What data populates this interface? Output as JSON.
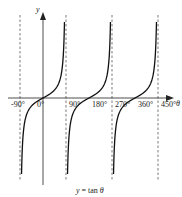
{
  "chart_data": {
    "type": "line",
    "title": "",
    "caption": "y = tan θ",
    "xlabel": "θ",
    "ylabel": "y",
    "x_ticks": [
      "-90°",
      "0°",
      "90°",
      "180°",
      "270°",
      "360°",
      "450°"
    ],
    "x_tick_values": [
      -90,
      0,
      90,
      180,
      270,
      360,
      450
    ],
    "asymptotes": [
      -90,
      90,
      270,
      450
    ],
    "zeros": [
      0,
      180,
      360
    ],
    "xlim": [
      -110,
      480
    ],
    "ylim": [
      -5,
      5
    ],
    "grid": false,
    "legend": null,
    "series": [
      {
        "name": "tan θ (branch 1)",
        "x_range": [
          -90,
          90
        ]
      },
      {
        "name": "tan θ (branch 2)",
        "x_range": [
          90,
          270
        ]
      },
      {
        "name": "tan θ (branch 3)",
        "x_range": [
          270,
          450
        ]
      }
    ]
  },
  "labels": {
    "ylabel": "y",
    "xlabel": "θ",
    "caption_y": "y",
    "caption_eq": " = tan ",
    "caption_theta": "θ",
    "ticks": [
      "-90°",
      "0°",
      "90°",
      "180°",
      "270°",
      "360°",
      "450°"
    ]
  }
}
